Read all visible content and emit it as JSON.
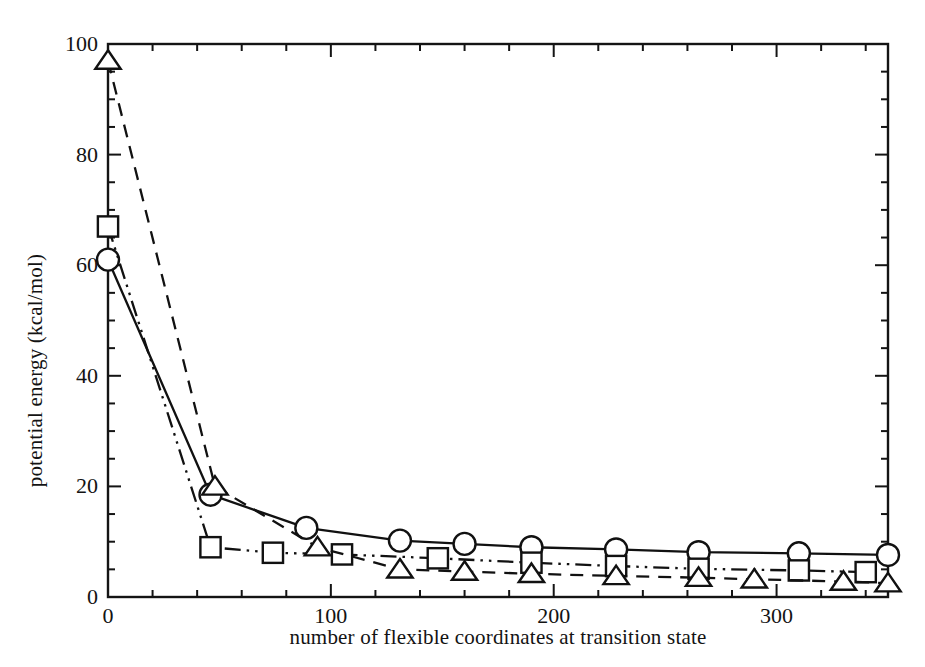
{
  "chart_data": {
    "type": "line",
    "title": "",
    "subtitle": "",
    "xlabel": "number of flexible coordinates at transition state",
    "ylabel": "potential energy (kcal/mol)",
    "xlim": [
      0,
      350
    ],
    "ylim": [
      0,
      100
    ],
    "xticks": [
      0,
      100,
      200,
      300
    ],
    "xtick_labels": [
      "0",
      "100",
      "200",
      "300"
    ],
    "x_minor_tick_step": 20,
    "yticks": [
      0,
      20,
      40,
      60,
      80,
      100
    ],
    "ytick_labels": [
      "0",
      "20",
      "40",
      "60",
      "80",
      "100"
    ],
    "y_minor_tick_step": 5,
    "grid": false,
    "legend": "none",
    "frame": "box",
    "tick_direction": "in",
    "series": [
      {
        "name": "circles",
        "marker": "circle-open",
        "linestyle": "solid",
        "color": "#111111",
        "x": [
          0,
          46,
          89,
          131,
          160,
          190,
          228,
          265,
          310,
          350
        ],
        "y": [
          61,
          18.5,
          12.5,
          10.2,
          9.6,
          9.0,
          8.6,
          8.1,
          7.9,
          7.6
        ]
      },
      {
        "name": "squares",
        "marker": "square-open",
        "linestyle": "dash-dot-dot",
        "color": "#111111",
        "x": [
          0,
          46,
          74,
          105,
          148,
          190,
          228,
          265,
          310,
          340
        ],
        "y": [
          67,
          9.0,
          8.0,
          7.7,
          7.0,
          6.2,
          5.6,
          5.1,
          4.8,
          4.5
        ]
      },
      {
        "name": "triangles",
        "marker": "triangle-open",
        "linestyle": "dashed",
        "color": "#111111",
        "x": [
          0,
          48,
          94,
          131,
          160,
          190,
          228,
          265,
          290,
          330,
          350
        ],
        "y": [
          97,
          20,
          9.0,
          5.0,
          4.6,
          4.2,
          3.8,
          3.5,
          3.2,
          2.8,
          2.5
        ]
      }
    ]
  }
}
